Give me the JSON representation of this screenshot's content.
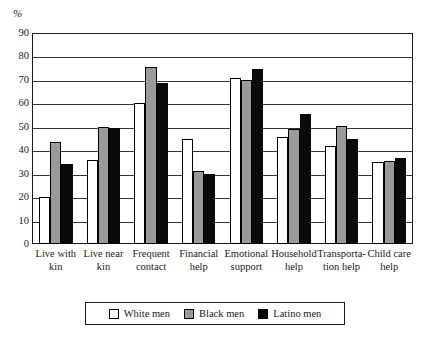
{
  "chart_data": {
    "type": "bar",
    "title": "",
    "subtitle": "",
    "xlabel": "",
    "ylabel": "%",
    "ylim": [
      0,
      90
    ],
    "ytick_step": 10,
    "yticks": [
      "90",
      "80",
      "70",
      "60",
      "50",
      "40",
      "30",
      "20",
      "10",
      "0"
    ],
    "grid": true,
    "legend_position": "bottom-center",
    "categories": [
      "Live with kin",
      "Live near kin",
      "Frequent contact",
      "Financial help",
      "Emotional support",
      "Household help",
      "Transporta-tion help",
      "Child care help"
    ],
    "category_lines": [
      [
        "Live with",
        "kin"
      ],
      [
        "Live near",
        "kin"
      ],
      [
        "Frequent",
        "contact"
      ],
      [
        "Financial",
        "help"
      ],
      [
        "Emotional",
        "support"
      ],
      [
        "Household",
        "help"
      ],
      [
        "Transporta-",
        "tion help"
      ],
      [
        "Child care",
        "help"
      ]
    ],
    "series": [
      {
        "name": "White men",
        "color": "#ffffff",
        "values": [
          20,
          36,
          60,
          45,
          71,
          45.5,
          42,
          35
        ]
      },
      {
        "name": "Black men",
        "color": "#9a9a9a",
        "values": [
          43.5,
          50,
          75.5,
          31,
          70,
          49,
          50.5,
          35.5
        ]
      },
      {
        "name": "Latino men",
        "color": "#0a0a0a",
        "values": [
          34,
          49.5,
          68.5,
          30,
          74.5,
          55.5,
          45,
          36.5
        ]
      }
    ]
  },
  "legend": {
    "items": [
      {
        "label": "White men",
        "swatch": "white"
      },
      {
        "label": "Black men",
        "swatch": "gray"
      },
      {
        "label": "Latino men",
        "swatch": "black"
      }
    ]
  },
  "axis": {
    "unit_label": "%"
  }
}
